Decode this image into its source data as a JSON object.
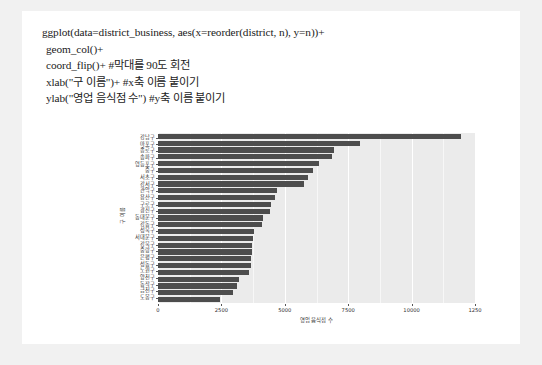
{
  "code": {
    "lines": [
      "ggplot(data=district_business, aes(x=reorder(district, n), y=n))+",
      "geom_col()+",
      "coord_flip()+ #막대를 90도 회전",
      "xlab(\"구 이름\")+ #x축 이름 붙이기",
      "ylab(\"영업 음식점 수\") #y축 이름 붙이기"
    ]
  },
  "chart_data": {
    "type": "bar",
    "orientation": "horizontal",
    "title": "",
    "xlabel": "영업 음식점 수",
    "ylabel": "구 이름",
    "xlim": [
      0,
      12500
    ],
    "xticks": [
      0,
      2500,
      5000,
      7500,
      10000,
      12500
    ],
    "xtick_labels": [
      "0",
      "2500",
      "5000",
      "7500",
      "10000",
      "1250"
    ],
    "grid": true,
    "legend": "none",
    "bar_color": "#4d4d4d",
    "panel_color": "#ebebeb",
    "categories": [
      "강남구",
      "마포구",
      "종로구",
      "송파구",
      "영등포구",
      "중구",
      "서초구",
      "강서구",
      "관악구",
      "용산구",
      "구로구",
      "광진구",
      "동대문구",
      "강동구",
      "성북구",
      "서대문구",
      "강북구",
      "중랑구",
      "은평구",
      "성동구",
      "노원구",
      "양천구",
      "동작구",
      "금천구",
      "도봉구"
    ],
    "values": [
      11950,
      7950,
      6950,
      6850,
      6350,
      6100,
      5900,
      5750,
      4700,
      4600,
      4450,
      4400,
      4150,
      4100,
      3800,
      3750,
      3700,
      3700,
      3650,
      3650,
      3600,
      3200,
      3100,
      2950,
      2450
    ]
  }
}
